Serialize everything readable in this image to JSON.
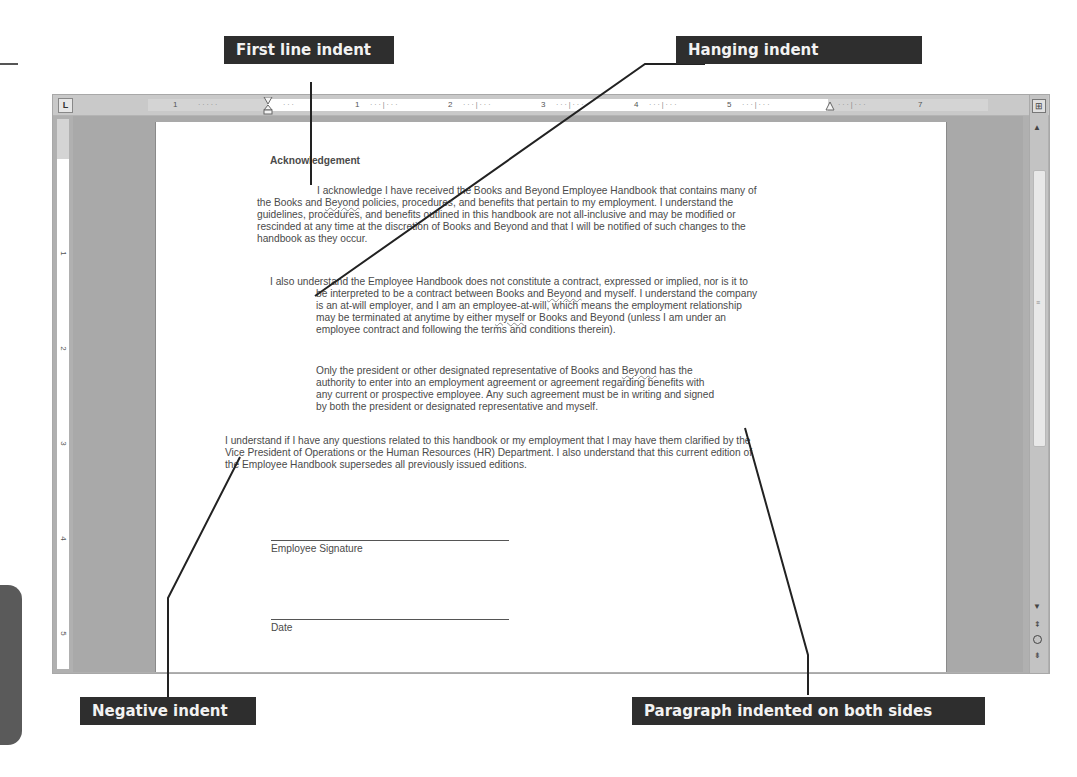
{
  "callouts": {
    "first_line_indent": "First line indent",
    "hanging_indent": "Hanging indent",
    "negative_indent": "Negative indent",
    "both_sides": "Paragraph indented on both sides"
  },
  "ruler": {
    "tab_selector": "L",
    "labels": [
      "1",
      "1",
      "2",
      "3",
      "4",
      "5",
      "7"
    ],
    "vertical_labels": [
      "1",
      "2",
      "3",
      "4",
      "5"
    ]
  },
  "document": {
    "heading": "Acknowledgement",
    "para1": {
      "first": "I acknowledge I have received the Books and Beyond Employee Handbook that contains many of",
      "l2a": "the Books and ",
      "l2b": "Beyond",
      "l2c": " policies, procedures, and benefits that pertain to my employment. I understand the",
      "l3": "guidelines, procedures, and benefits outlined in this handbook are not all-inclusive and may be modified or",
      "l4": "rescinded at any time at the discretion of Books and Beyond and that I will be notified of such changes to the",
      "l5": "handbook as they occur."
    },
    "para2": {
      "first": "I also understand the Employee Handbook does not constitute a contract, expressed or implied, nor is it to",
      "l2a": "be interpreted to be a contract between Books and ",
      "l2b": "Beyond",
      "l2c": " and myself. I understand the company",
      "l3": "is an at-will employer, and I am an employee-at-will, which means the employment relationship",
      "l4a": "may be terminated at anytime by either ",
      "l4b": "myself",
      "l4c": " or Books and Beyond (unless I am under an",
      "l5": "employee contract and following the terms and conditions therein)."
    },
    "para3": {
      "l1a": "Only the president or other designated representative of Books and ",
      "l1b": "Beyond",
      "l1c": " has the",
      "l2": "authority to enter into an employment agreement or agreement regarding benefits with",
      "l3": "any current or prospective employee. Any such agreement must be in writing and signed",
      "l4": "by both the president or designated representative and myself."
    },
    "para4": {
      "l1": "I understand if I have any questions related to this handbook or my employment that I may have them clarified by the",
      "l2": "Vice President of Operations or the Human Resources (HR) Department. I also understand that this current edition of",
      "l3": "the Employee Handbook supersedes all previously issued editions."
    },
    "signature_label": "Employee Signature",
    "date_label": "Date"
  }
}
